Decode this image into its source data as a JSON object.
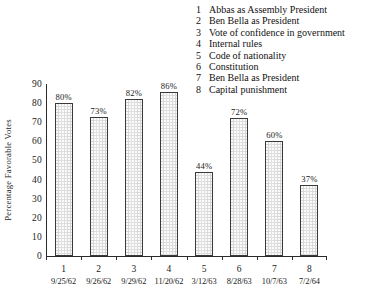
{
  "legend": {
    "items": [
      {
        "num": "1",
        "label": "Abbas as Assembly President"
      },
      {
        "num": "2",
        "label": "Ben Bella as President"
      },
      {
        "num": "3",
        "label": "Vote of confidence in government"
      },
      {
        "num": "4",
        "label": "Internal rules"
      },
      {
        "num": "5",
        "label": "Code of nationality"
      },
      {
        "num": "6",
        "label": "Constitution"
      },
      {
        "num": "7",
        "label": "Ben Bella as President"
      },
      {
        "num": "8",
        "label": "Capital punishment"
      }
    ]
  },
  "chart_data": {
    "type": "bar",
    "title": "",
    "xlabel": "",
    "ylabel": "Percentage Favorable Votes",
    "ylim": [
      0,
      90
    ],
    "yticks": [
      0,
      10,
      20,
      30,
      40,
      50,
      60,
      70,
      80,
      90
    ],
    "ytick_labels": [
      "0",
      "10",
      "20",
      "30",
      "40",
      "50",
      "60",
      "70",
      "80",
      "90"
    ],
    "grid": false,
    "legend_position": "top-right",
    "categories": [
      "1",
      "2",
      "3",
      "4",
      "5",
      "6",
      "7",
      "8"
    ],
    "x_sublabels": [
      "9/25/62",
      "9/26/62",
      "9/29/62",
      "11/20/62",
      "3/12/63",
      "8/28/63",
      "10/7/63",
      "7/2/64"
    ],
    "values": [
      80,
      73,
      82,
      86,
      44,
      72,
      60,
      37
    ],
    "value_labels": [
      "80%",
      "73%",
      "82%",
      "86%",
      "44%",
      "72%",
      "60%",
      "37%"
    ],
    "bar_color": "#d9d9d9",
    "bar_edge_color": "#3a3a3a",
    "axis_color": "#2b2b2b",
    "text_color": "#1a1a1a"
  }
}
